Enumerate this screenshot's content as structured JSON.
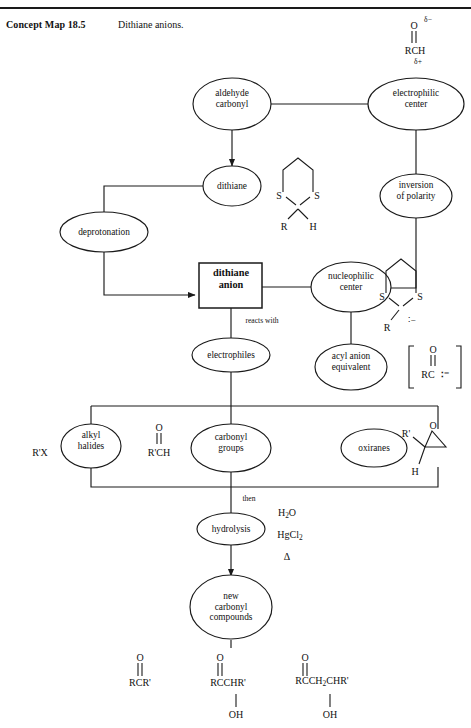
{
  "header": {
    "label": "Concept Map 18.5",
    "title": "Dithiane anions."
  },
  "nodes": {
    "aldehyde_carbonyl": "aldehyde\ncarbonyl",
    "aldehyde_carbonyl_l1": "aldehyde",
    "aldehyde_carbonyl_l2": "carbonyl",
    "electrophilic_center_l1": "electrophilic",
    "electrophilic_center_l2": "center",
    "dithiane": "dithiane",
    "inversion_l1": "inversion",
    "inversion_l2": "of polarity",
    "deprotonation": "deprotonation",
    "dithiane_anion_l1": "dithiane",
    "dithiane_anion_l2": "anion",
    "nucleophilic_center_l1": "nucleophilic",
    "nucleophilic_center_l2": "center",
    "electrophiles": "electrophiles",
    "acyl_anion_l1": "acyl anion",
    "acyl_anion_l2": "equivalent",
    "alkyl_halides_l1": "alkyl",
    "alkyl_halides_l2": "halides",
    "carbonyl_groups_l1": "carbonyl",
    "carbonyl_groups_l2": "groups",
    "oxiranes": "oxiranes",
    "hydrolysis": "hydrolysis",
    "new_carbonyl_l1": "new",
    "new_carbonyl_l2": "carbonyl",
    "new_carbonyl_l3": "compounds"
  },
  "edge_labels": {
    "reacts_with": "reacts with",
    "then": "then"
  },
  "formulas": {
    "aldehyde": {
      "oxygen": "O",
      "delta_minus": "δ−",
      "body": "RCH",
      "delta_plus": "δ+"
    },
    "dithiane_ring": {
      "s_left": "S",
      "s_right": "S",
      "sub_left": "R",
      "sub_right": "H"
    },
    "dithiane_anion_ring": {
      "s_left": "S",
      "s_right": "S",
      "sub_left": "R",
      "carbanion": "∶−"
    },
    "acyl_anion_equivalent": {
      "bracket_open": "[",
      "bracket_close": "]",
      "oxygen": "O",
      "body": "RC",
      "charge": "∶⁻"
    },
    "alkyl_halide": "R'X",
    "aldehyde_electrophile": {
      "oxygen": "O",
      "body": "R'CH"
    },
    "oxirane": {
      "oxygen": "O",
      "sub_left": "R'",
      "sub_bottom": "H"
    }
  },
  "conditions": {
    "water": "H2O",
    "mercuric_chloride": "HgCl2",
    "heat": "Δ"
  },
  "products": [
    {
      "name": "ketone",
      "oxygen": "O",
      "body": "RCR'",
      "hydroxyl": null
    },
    {
      "name": "alpha-hydroxy-ketone",
      "oxygen": "O",
      "body": "RCCHR'",
      "hydroxyl": "OH"
    },
    {
      "name": "beta-hydroxy-ketone",
      "oxygen": "O",
      "body": "RCCH2CHR'",
      "hydroxyl": "OH"
    }
  ],
  "colors": {
    "ink": "#1a1a1a",
    "paper": "#ffffff"
  }
}
